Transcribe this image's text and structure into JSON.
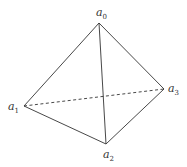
{
  "diagram": {
    "vertices": [
      {
        "id": "a0",
        "base": "a",
        "sub": "0",
        "x": 99,
        "y": 23,
        "lx": 96,
        "ly": 16
      },
      {
        "id": "a1",
        "base": "a",
        "sub": "1",
        "x": 24,
        "y": 106,
        "lx": 8,
        "ly": 110
      },
      {
        "id": "a2",
        "base": "a",
        "sub": "2",
        "x": 106,
        "y": 144,
        "lx": 103,
        "ly": 158
      },
      {
        "id": "a3",
        "base": "a",
        "sub": "3",
        "x": 164,
        "y": 89,
        "lx": 168,
        "ly": 92
      }
    ],
    "edges": [
      {
        "from": "a0",
        "to": "a1",
        "style": "solid"
      },
      {
        "from": "a0",
        "to": "a2",
        "style": "solid"
      },
      {
        "from": "a0",
        "to": "a3",
        "style": "solid"
      },
      {
        "from": "a1",
        "to": "a2",
        "style": "solid"
      },
      {
        "from": "a2",
        "to": "a3",
        "style": "solid"
      },
      {
        "from": "a1",
        "to": "a3",
        "style": "dashed"
      }
    ]
  }
}
